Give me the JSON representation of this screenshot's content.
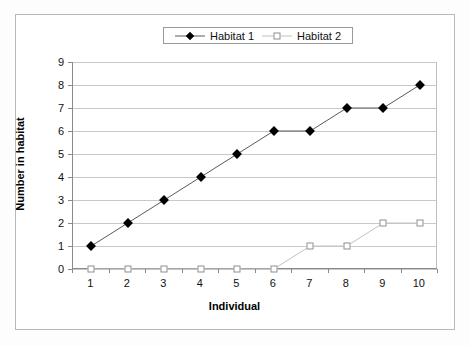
{
  "chart_data": {
    "type": "line",
    "title": "",
    "xlabel": "Individual",
    "ylabel": "Number in habitat",
    "categories": [
      1,
      2,
      3,
      4,
      5,
      6,
      7,
      8,
      9,
      10
    ],
    "xtick_labels": [
      "1",
      "2",
      "3",
      "4",
      "5",
      "6",
      "7",
      "8",
      "9",
      "10"
    ],
    "ytick_labels": [
      "0",
      "1",
      "2",
      "3",
      "4",
      "5",
      "6",
      "7",
      "8",
      "9"
    ],
    "ylim": [
      0,
      9
    ],
    "grid": "horizontal",
    "legend_position": "top-center",
    "series": [
      {
        "name": "Habitat 1",
        "marker": "filled-diamond",
        "marker_color": "#000000",
        "line_color": "#5a5a5a",
        "values": [
          1,
          2,
          3,
          4,
          5,
          6,
          6,
          7,
          7,
          8
        ]
      },
      {
        "name": "Habitat 2",
        "marker": "open-square",
        "marker_color": "#ffffff",
        "line_color": "#c2c2c2",
        "values": [
          0,
          0,
          0,
          0,
          0,
          0,
          1,
          1,
          2,
          2
        ]
      }
    ]
  },
  "legend": {
    "entries": [
      {
        "label": "Habitat 1"
      },
      {
        "label": "Habitat 2"
      }
    ]
  },
  "colors": {
    "background": "#ffffff",
    "gridline": "#c8c8c8",
    "axis": "#8a8a8a",
    "frame": "#b9b9b9",
    "text": "#111111"
  }
}
